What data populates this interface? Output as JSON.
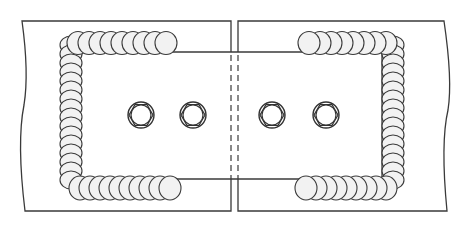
{
  "figure": {
    "title": "Bolted and welded splice (cover) plate joint between two plates",
    "colors": {
      "line": "#3a3a3a",
      "bead_fill": "#f2f2f2",
      "background": "#ffffff"
    },
    "base_plates": [
      {
        "id": "left-plate",
        "x1": 22,
        "x2": 231,
        "y1": 21,
        "y2": 211,
        "break_edge": "left"
      },
      {
        "id": "right-plate",
        "x1": 238,
        "x2": 451,
        "y1": 21,
        "y2": 211,
        "break_edge": "right"
      }
    ],
    "cover_plate": {
      "x1": 80,
      "x2": 382,
      "y1": 52,
      "y2": 179
    },
    "hidden_gap_lines": [
      231,
      238
    ],
    "bolts": [
      {
        "cx": 141,
        "cy": 115,
        "r": 13
      },
      {
        "cx": 193,
        "cy": 115,
        "r": 13
      },
      {
        "cx": 272,
        "cy": 115,
        "r": 13
      },
      {
        "cx": 326,
        "cy": 115,
        "r": 13
      }
    ],
    "welds": [
      {
        "side": "left",
        "shape": "C-shaped fillet weld around left end of cover plate"
      },
      {
        "side": "right",
        "shape": "reverse-C fillet weld around right end of cover plate"
      }
    ]
  }
}
